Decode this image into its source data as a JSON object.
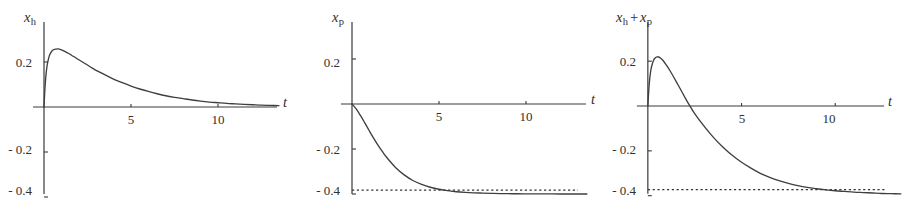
{
  "figure": {
    "background": "#ffffff",
    "axis_color": "#3a3a3a",
    "curve_color": "#3f3f3f",
    "dash_color": "#333333",
    "panel_count": 3
  },
  "chart_data": [
    {
      "type": "line",
      "title": "x_h",
      "title_parts": {
        "var": "x",
        "sub": "h"
      },
      "xlabel": "t",
      "ylabel": "",
      "xlim": [
        -0.55,
        13.6
      ],
      "ylim": [
        -0.47,
        0.32
      ],
      "xticks": [
        5,
        10
      ],
      "xtick_labels": [
        "5",
        "10"
      ],
      "yticks": [
        0.2,
        -0.2,
        -0.4
      ],
      "ytick_labels": [
        "0.2",
        "- 0.2",
        "- 0.4"
      ],
      "grid": false,
      "legend": null,
      "annotations": [],
      "series": [
        {
          "name": "x_h",
          "style": "solid",
          "x": [
            0,
            0.05,
            0.1,
            0.15,
            0.2,
            0.3,
            0.4,
            0.5,
            0.6,
            0.8,
            1.0,
            1.2,
            1.4,
            1.6,
            1.8,
            2.0,
            2.4,
            2.8,
            3.2,
            3.6,
            4.0,
            4.5,
            5.0,
            5.5,
            6.0,
            6.5,
            7.0,
            7.5,
            8.0,
            8.5,
            9.0,
            9.5,
            10.0,
            10.5,
            11.0,
            11.5,
            12.0,
            12.5,
            13.0,
            13.5
          ],
          "y": [
            0.0,
            0.077,
            0.131,
            0.168,
            0.194,
            0.226,
            0.243,
            0.252,
            0.256,
            0.258,
            0.254,
            0.247,
            0.239,
            0.229,
            0.22,
            0.21,
            0.191,
            0.172,
            0.155,
            0.139,
            0.124,
            0.108,
            0.093,
            0.08,
            0.069,
            0.059,
            0.05,
            0.043,
            0.037,
            0.031,
            0.026,
            0.022,
            0.019,
            0.016,
            0.014,
            0.012,
            0.01,
            0.008,
            0.007,
            0.006
          ]
        }
      ]
    },
    {
      "type": "line",
      "title": "x_p",
      "title_parts": {
        "var": "x",
        "sub": "p"
      },
      "xlabel": "t",
      "ylabel": "",
      "xlim": [
        -0.55,
        13.6
      ],
      "ylim": [
        -0.47,
        0.32
      ],
      "xticks": [
        5,
        10
      ],
      "xtick_labels": [
        "5",
        "10"
      ],
      "yticks": [
        0.2,
        -0.2,
        -0.4
      ],
      "ytick_labels": [
        "0.2",
        "- 0.2",
        "- 0.4"
      ],
      "grid": false,
      "legend": null,
      "annotations": [
        {
          "type": "hline",
          "y": -0.4,
          "style": "dashed",
          "label": "asymptote y = -0.4"
        }
      ],
      "series": [
        {
          "name": "x_p",
          "style": "solid",
          "x": [
            0,
            0.25,
            0.5,
            0.75,
            1.0,
            1.25,
            1.5,
            1.75,
            2.0,
            2.5,
            3.0,
            3.5,
            4.0,
            4.5,
            5.0,
            5.5,
            6.0,
            6.5,
            7.0,
            7.5,
            8.0,
            8.5,
            9.0,
            9.5,
            10.0,
            10.5,
            11.0,
            11.5,
            12.0,
            12.5,
            13.0,
            13.5
          ],
          "y": [
            0.0,
            -0.023,
            -0.053,
            -0.086,
            -0.12,
            -0.153,
            -0.184,
            -0.212,
            -0.238,
            -0.282,
            -0.315,
            -0.34,
            -0.357,
            -0.37,
            -0.379,
            -0.385,
            -0.39,
            -0.393,
            -0.395,
            -0.396,
            -0.397,
            -0.398,
            -0.3985,
            -0.399,
            -0.3993,
            -0.3995,
            -0.3996,
            -0.3997,
            -0.3998,
            -0.3999,
            -0.3999,
            -0.4
          ]
        }
      ]
    },
    {
      "type": "line",
      "title": "x_h + x_p",
      "title_parts": {
        "var1": "x",
        "sub1": "h",
        "op": "+",
        "var2": "x",
        "sub2": "p"
      },
      "xlabel": "t",
      "ylabel": "",
      "xlim": [
        -0.55,
        13.6
      ],
      "ylim": [
        -0.47,
        0.32
      ],
      "xticks": [
        5,
        10
      ],
      "xtick_labels": [
        "5",
        "10"
      ],
      "yticks": [
        0.2,
        -0.2,
        -0.4
      ],
      "ytick_labels": [
        "0.2",
        "- 0.2",
        "- 0.4"
      ],
      "grid": false,
      "legend": null,
      "annotations": [
        {
          "type": "hline",
          "y": -0.4,
          "style": "dashed",
          "label": "asymptote y = -0.4"
        }
      ],
      "series": [
        {
          "name": "x_h + x_p",
          "style": "solid",
          "x": [
            0,
            0.05,
            0.1,
            0.15,
            0.2,
            0.3,
            0.4,
            0.5,
            0.6,
            0.8,
            1.0,
            1.2,
            1.4,
            1.6,
            1.8,
            2.0,
            2.2,
            2.5,
            3.0,
            3.5,
            4.0,
            4.5,
            5.0,
            5.5,
            6.0,
            6.5,
            7.0,
            7.5,
            8.0,
            8.5,
            9.0,
            9.5,
            10.0,
            10.5,
            11.0,
            11.5,
            12.0,
            12.5,
            13.0,
            13.5
          ],
          "y": [
            0.0,
            0.072,
            0.121,
            0.154,
            0.176,
            0.203,
            0.215,
            0.219,
            0.218,
            0.204,
            0.181,
            0.155,
            0.126,
            0.096,
            0.066,
            0.035,
            0.006,
            -0.034,
            -0.09,
            -0.14,
            -0.183,
            -0.22,
            -0.251,
            -0.277,
            -0.3,
            -0.318,
            -0.333,
            -0.345,
            -0.355,
            -0.363,
            -0.369,
            -0.374,
            -0.378,
            -0.381,
            -0.384,
            -0.386,
            -0.388,
            -0.39,
            -0.391,
            -0.392
          ]
        }
      ]
    }
  ]
}
